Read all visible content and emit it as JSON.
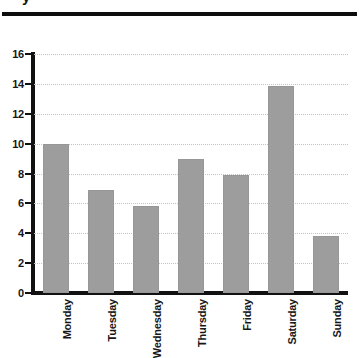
{
  "page": {
    "clipped_header_text": "y",
    "background_color": "#ffffff"
  },
  "chart_data": {
    "type": "bar",
    "title": "",
    "subtitle": "",
    "xlabel": "",
    "ylabel": "",
    "categories": [
      "Monday",
      "Tuesday",
      "Wednesday",
      "Thursday",
      "Friday",
      "Saturday",
      "Sunday"
    ],
    "values": [
      9.95,
      6.9,
      5.85,
      8.95,
      7.9,
      13.85,
      3.85
    ],
    "ylim": [
      0,
      16
    ],
    "ytick_values": [
      0,
      2,
      4,
      6,
      8,
      10,
      12,
      14,
      16
    ],
    "ytick_labels": [
      "0",
      "2",
      "4",
      "6",
      "8",
      "10",
      "12",
      "14",
      "16"
    ],
    "grid": true,
    "grid_axis": "y",
    "grid_style": "dotted",
    "grid_color": "#c3c3c3",
    "legend": false,
    "legend_position": "none",
    "bar_color": "#9d9d9d",
    "bar_edge_color": "#979797",
    "axis_color": "#111111",
    "xtick_rotation": 90,
    "annotations": []
  }
}
